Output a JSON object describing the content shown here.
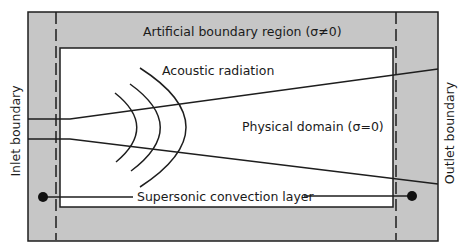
{
  "diagram": {
    "colors": {
      "boundary_fill": "#c6c6c6",
      "domain_fill": "#ffffff",
      "stroke": "#1e1e1e"
    },
    "labels": {
      "artificial_region": "Artificial boundary region (σ≠0)",
      "acoustic_radiation": "Acoustic radiation",
      "physical_domain": "Physical domain (σ=0)",
      "supersonic_layer": "Supersonic convection layer",
      "inlet_boundary": "Inlet boundary",
      "outlet_boundary": "Outlet boundary"
    },
    "regions": [
      {
        "name": "Artificial boundary region",
        "sigma": "σ≠0"
      },
      {
        "name": "Physical domain",
        "sigma": "σ=0"
      }
    ],
    "elements": {
      "acoustic_wavefronts": 3,
      "jet_shear_lines": 2,
      "dashed_boundaries": [
        "inlet",
        "outlet"
      ],
      "convection_layer_endpoints": 2
    }
  }
}
